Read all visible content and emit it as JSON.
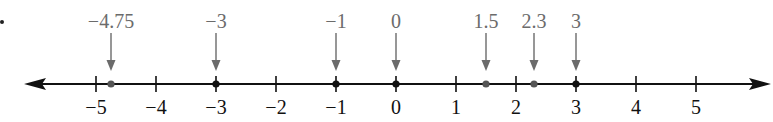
{
  "figure": {
    "type": "number-line",
    "colors": {
      "axis": "#111111",
      "pointer": "#6b6b6b",
      "dot": "#555555",
      "label": "#6b6b6b",
      "tick_label": "#111111"
    }
  },
  "chart_data": {
    "type": "number-line",
    "axis": {
      "min": -5,
      "max": 5,
      "ticks": [
        -5,
        -4,
        -3,
        -2,
        -1,
        0,
        1,
        2,
        3,
        4,
        5
      ],
      "arrows": "both"
    },
    "tick_labels": [
      "−5",
      "−4",
      "−3",
      "−2",
      "−1",
      "0",
      "1",
      "2",
      "3",
      "4",
      "5"
    ],
    "points": [
      {
        "value": -4.75,
        "label": "−4.75"
      },
      {
        "value": -3,
        "label": "−3"
      },
      {
        "value": -1,
        "label": "−1"
      },
      {
        "value": 0,
        "label": "0"
      },
      {
        "value": 1.5,
        "label": "1.5"
      },
      {
        "value": 2.3,
        "label": "2.3"
      },
      {
        "value": 3,
        "label": "3"
      }
    ]
  }
}
